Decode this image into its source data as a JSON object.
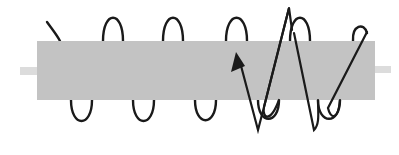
{
  "diagram": {
    "type": "solenoid-with-core",
    "colors": {
      "background": "#ffffff",
      "core": "#c3c3c3",
      "core_stub": "#dcdcdc",
      "wire": "#1a1a1a",
      "arrow": "#1a1a1a"
    },
    "core": {
      "x": 37,
      "y": 41,
      "width": 338,
      "height": 59
    },
    "left_stub": {
      "x": 20,
      "y": 67,
      "width": 17,
      "height": 8
    },
    "right_stub": {
      "x": 375,
      "y": 66,
      "width": 16,
      "height": 7
    },
    "coil_turns_visible": 6,
    "upper_loops": [
      {
        "x1": 103,
        "x2": 123,
        "peak_y": 17
      },
      {
        "x1": 163,
        "x2": 183,
        "peak_y": 17
      },
      {
        "x1": 226,
        "x2": 247,
        "peak_y": 17
      },
      {
        "x1": 290,
        "x2": 310,
        "peak_y": 17
      },
      {
        "x1": 352,
        "x2": 367,
        "peak_y": 28
      }
    ],
    "lower_loops": [
      {
        "x1": 71,
        "x2": 92,
        "trough_y": 123
      },
      {
        "x1": 133,
        "x2": 154,
        "trough_y": 123
      },
      {
        "x1": 195,
        "x2": 216,
        "trough_y": 122
      },
      {
        "x1": 258,
        "x2": 279,
        "trough_y": 120
      },
      {
        "x1": 318,
        "x2": 340,
        "trough_y": 120
      }
    ],
    "arrow": {
      "direction": "up-left",
      "head": {
        "x": 236,
        "y": 52
      },
      "path_points": [
        [
          365,
          28
        ],
        [
          328,
          108
        ],
        [
          314,
          130
        ],
        [
          294,
          33
        ],
        [
          289,
          8
        ],
        [
          264,
          107
        ],
        [
          258,
          130
        ],
        [
          238,
          58
        ]
      ]
    },
    "labels": []
  }
}
